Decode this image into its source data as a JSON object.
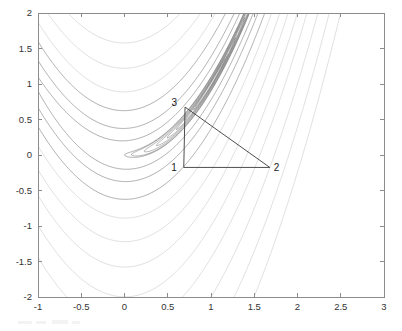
{
  "figure": {
    "type": "contour-plot",
    "width": 402,
    "height": 331,
    "background_color": "#ffffff",
    "axes_color": "#8c8c8c",
    "title": "",
    "plot_box": {
      "left": 38,
      "top": 13,
      "right": 384,
      "bottom": 297
    }
  },
  "chart_data": {
    "type": "line",
    "subtype": "contour",
    "title": "",
    "xlabel": "",
    "ylabel": "",
    "xlim": [
      -1,
      3
    ],
    "ylim": [
      -2,
      2
    ],
    "grid": false,
    "legend": "none",
    "xticks": [
      -1,
      -0.5,
      0,
      0.5,
      1,
      1.5,
      2,
      2.5,
      3
    ],
    "xtick_labels": [
      "-1",
      "-0.5",
      "0",
      "0.5",
      "1",
      "1.5",
      "2",
      "2.5",
      "3"
    ],
    "yticks": [
      -2,
      -1.5,
      -1,
      -0.5,
      0,
      0.5,
      1,
      1.5,
      2
    ],
    "ytick_labels": [
      "-2",
      "-1.5",
      "-1",
      "-0.5",
      "0",
      "0.5",
      "1",
      "1.5",
      "2"
    ],
    "function": "rosenbrock",
    "function_expression": "f(x,y) = (1-x)^2 + 100(y-x^2)^2",
    "contour_color": "#b4b4b4",
    "contour_color_dense": "#6e6e6e",
    "contour_levels": [
      1,
      5,
      15,
      40,
      80,
      150,
      250,
      400,
      600,
      900,
      1300,
      1800
    ],
    "overlay": {
      "name": "simplex-triangle",
      "line_color": "#3a3a3a",
      "vertices": [
        {
          "label": "1",
          "x": 0.685,
          "y": -0.175,
          "label_dx": -7,
          "label_dy": 4
        },
        {
          "label": "2",
          "x": 1.68,
          "y": -0.175,
          "label_dx": 4,
          "label_dy": 4
        },
        {
          "label": "3",
          "x": 0.7,
          "y": 0.675,
          "label_dx": -8,
          "label_dy": -1
        }
      ],
      "edges": [
        [
          0,
          1
        ],
        [
          1,
          2
        ],
        [
          2,
          0
        ]
      ]
    },
    "series": [
      {
        "name": "contour-levels",
        "values": [
          1,
          5,
          15,
          40,
          80,
          150,
          250,
          400,
          600,
          900,
          1300,
          1800
        ]
      }
    ],
    "annotations": [
      {
        "text": "1",
        "x": 0.685,
        "y": -0.175
      },
      {
        "text": "2",
        "x": 1.68,
        "y": -0.175
      },
      {
        "text": "3",
        "x": 0.7,
        "y": 0.675
      }
    ]
  }
}
